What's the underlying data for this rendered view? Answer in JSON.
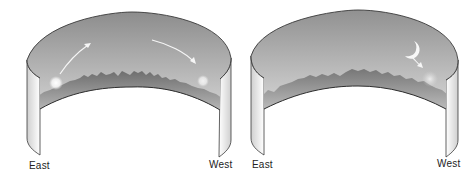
{
  "figure": {
    "panels": [
      {
        "id": "sun-panel",
        "description": "Sun rising in the east and setting in the west",
        "labels": {
          "left": "East",
          "right": "West"
        },
        "celestial_object": "sun"
      },
      {
        "id": "moon-panel",
        "description": "Crescent moon setting in the west",
        "labels": {
          "left": "East",
          "right": "West"
        },
        "celestial_object": "moon"
      }
    ],
    "colors": {
      "sky_top": "#8f8f8f",
      "sky_bottom": "#d6d6d6",
      "landscape": "#7a7a7a",
      "wall": "#f2f2f2",
      "outline": "#3a3a3a",
      "arrow": "#f4f4f4"
    }
  }
}
